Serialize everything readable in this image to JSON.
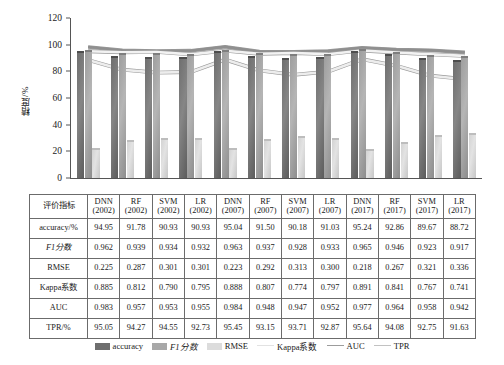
{
  "chart_data": {
    "type": "bar",
    "title": "",
    "xlabel": "",
    "ylabel": "精度/%",
    "ylim": [
      0,
      120
    ],
    "yticks": [
      0,
      20,
      40,
      60,
      80,
      100,
      120
    ],
    "grid": false,
    "legend_position": "bottom",
    "categories": [
      "DNN (2002)",
      "RF (2002)",
      "SVM (2002)",
      "LR (2002)",
      "DNN (2007)",
      "RF (2007)",
      "SVM (2007)",
      "LR (2007)",
      "DNN (2017)",
      "RF (2017)",
      "SVM (2017)",
      "LR (2017)"
    ],
    "series": [
      {
        "name": "accuracy",
        "kind": "bar",
        "values": [
          94.95,
          91.78,
          90.93,
          90.93,
          95.04,
          91.5,
          90.18,
          91.03,
          95.24,
          92.86,
          89.67,
          88.72
        ]
      },
      {
        "name": "F1分数",
        "kind": "bar",
        "values": [
          96.2,
          93.9,
          93.4,
          93.2,
          96.3,
          93.7,
          92.8,
          93.3,
          96.5,
          94.6,
          92.3,
          91.7
        ]
      },
      {
        "name": "RMSE",
        "kind": "bar",
        "values": [
          22.5,
          28.7,
          30.1,
          30.1,
          22.3,
          29.2,
          31.3,
          30.0,
          21.8,
          26.7,
          32.1,
          33.6
        ]
      },
      {
        "name": "Kappa系数",
        "kind": "line",
        "values": [
          88.5,
          81.2,
          79.0,
          79.5,
          88.8,
          80.7,
          77.4,
          79.7,
          89.1,
          84.1,
          76.7,
          74.1
        ]
      },
      {
        "name": "AUC",
        "kind": "line",
        "values": [
          98.3,
          95.7,
          95.3,
          95.5,
          98.4,
          94.8,
          94.7,
          95.2,
          97.7,
          96.4,
          95.8,
          94.2
        ]
      },
      {
        "name": "TPR",
        "kind": "line",
        "values": [
          95.05,
          94.27,
          94.55,
          92.73,
          95.45,
          93.15,
          93.71,
          92.87,
          95.64,
          94.08,
          92.75,
          91.63
        ]
      }
    ]
  },
  "legend": {
    "items": [
      {
        "label": "accuracy",
        "type": "bar",
        "color": "#6e6e6e"
      },
      {
        "label": "F1分数",
        "type": "bar",
        "color": "#a8a8a8"
      },
      {
        "label": "RMSE",
        "type": "bar",
        "color": "#dcdcdc"
      },
      {
        "label": "Kappa系数",
        "type": "line",
        "color": "#e2e2e2"
      },
      {
        "label": "AUC",
        "type": "line",
        "color": "#9c9c9c"
      },
      {
        "label": "TPR",
        "type": "line",
        "color": "#c2c2c2"
      }
    ]
  },
  "table": {
    "corner_label": "评价指标",
    "columns": [
      {
        "model": "DNN",
        "year": "(2002)"
      },
      {
        "model": "RF",
        "year": "(2002)"
      },
      {
        "model": "SVM",
        "year": "(2002)"
      },
      {
        "model": "LR",
        "year": "(2002)"
      },
      {
        "model": "DNN",
        "year": "(2007)"
      },
      {
        "model": "RF",
        "year": "(2007)"
      },
      {
        "model": "SVM",
        "year": "(2007)"
      },
      {
        "model": "LR",
        "year": "(2007)"
      },
      {
        "model": "DNN",
        "year": "(2017)"
      },
      {
        "model": "RF",
        "year": "(2017)"
      },
      {
        "model": "SVM",
        "year": "(2017)"
      },
      {
        "model": "LR",
        "year": "(2017)"
      }
    ],
    "rows": [
      {
        "label": "accuracy/%",
        "italic": false,
        "values": [
          "94.95",
          "91.78",
          "90.93",
          "90.93",
          "95.04",
          "91.50",
          "90.18",
          "91.03",
          "95.24",
          "92.86",
          "89.67",
          "88.72"
        ]
      },
      {
        "label": "F1分数",
        "italic": true,
        "values": [
          "0.962",
          "0.939",
          "0.934",
          "0.932",
          "0.963",
          "0.937",
          "0.928",
          "0.933",
          "0.965",
          "0.946",
          "0.923",
          "0.917"
        ]
      },
      {
        "label": "RMSE",
        "italic": false,
        "values": [
          "0.225",
          "0.287",
          "0.301",
          "0.301",
          "0.223",
          "0.292",
          "0.313",
          "0.300",
          "0.218",
          "0.267",
          "0.321",
          "0.336"
        ]
      },
      {
        "label": "Kappa系数",
        "italic": false,
        "values": [
          "0.885",
          "0.812",
          "0.790",
          "0.795",
          "0.888",
          "0.807",
          "0.774",
          "0.797",
          "0.891",
          "0.841",
          "0.767",
          "0.741"
        ]
      },
      {
        "label": "AUC",
        "italic": false,
        "values": [
          "0.983",
          "0.957",
          "0.953",
          "0.955",
          "0.984",
          "0.948",
          "0.947",
          "0.952",
          "0.977",
          "0.964",
          "0.958",
          "0.942"
        ]
      },
      {
        "label": "TPR/%",
        "italic": false,
        "values": [
          "95.05",
          "94.27",
          "94.55",
          "92.73",
          "95.45",
          "93.15",
          "93.71",
          "92.87",
          "95.64",
          "94.08",
          "92.75",
          "91.63"
        ]
      }
    ]
  }
}
